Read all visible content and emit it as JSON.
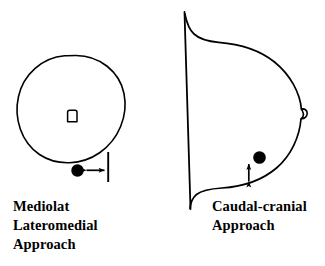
{
  "figure": {
    "background_color": "#ffffff",
    "stroke_color": "#000000",
    "width": 325,
    "height": 266
  },
  "panels": [
    {
      "id": "mediolateral",
      "view": "cross-sectional circular view",
      "caption_lines": [
        "Mediolat",
        "Lateromedial",
        "Approach"
      ],
      "markers": {
        "center_structure": "small rounded rectangle outline",
        "target_dot": "filled black circle",
        "reference_line": "vertical tick line",
        "motion_arrow": "horizontal double-headed arrow"
      }
    },
    {
      "id": "caudalcranial",
      "view": "sagittal profile view",
      "caption_lines": [
        "Caudal-cranial",
        "Approach"
      ],
      "markers": {
        "edge_feature": "small loop bump on right margin",
        "target_dot": "filled black circle",
        "motion_arrow": "vertical double-headed arrow"
      }
    }
  ],
  "captions": {
    "mediolateral": {
      "line1": "Mediolat",
      "line2": "Lateromedial",
      "line3": "Approach"
    },
    "caudalcranial": {
      "line1": "Caudal-cranial",
      "line2": "Approach"
    }
  }
}
